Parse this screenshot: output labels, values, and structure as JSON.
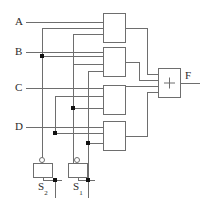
{
  "diagram": {
    "colors": {
      "wire": "#6e6e6e",
      "junction": "#111111",
      "box_fill": "#ffffff",
      "background": "#ffffff",
      "label_text": "#2b2b2b"
    }
  },
  "inputs": [
    {
      "name": "input-a",
      "label": "A",
      "x": 15,
      "y": 16,
      "line_y": 22
    },
    {
      "name": "input-b",
      "label": "B",
      "x": 15,
      "y": 46,
      "line_y": 52
    },
    {
      "name": "input-c",
      "label": "C",
      "x": 15,
      "y": 82,
      "line_y": 88
    },
    {
      "name": "input-d",
      "label": "D",
      "x": 15,
      "y": 121,
      "line_y": 127
    }
  ],
  "gates": [
    {
      "name": "gate-1",
      "label": "",
      "x": 103,
      "y": 13,
      "w": 22,
      "h": 29
    },
    {
      "name": "gate-2",
      "label": "",
      "x": 103,
      "y": 47,
      "w": 22,
      "h": 29
    },
    {
      "name": "gate-3",
      "label": "",
      "x": 103,
      "y": 85,
      "w": 22,
      "h": 29
    },
    {
      "name": "gate-4",
      "label": "",
      "x": 103,
      "y": 121,
      "w": 22,
      "h": 29
    }
  ],
  "adder": {
    "name": "summing-block",
    "symbol": "+",
    "x": 158,
    "y": 68,
    "w": 22,
    "h": 29
  },
  "output": {
    "name": "output-f",
    "label": "F",
    "x": 185,
    "y": 70
  },
  "switches": [
    {
      "name": "switch-s2",
      "label": "S",
      "subscript": "2",
      "box_x": 33,
      "box_y": 163,
      "box_w": 19,
      "box_h": 14,
      "label_x": 38,
      "label_y": 186
    },
    {
      "name": "switch-s1",
      "label": "S",
      "subscript": "1",
      "box_x": 68,
      "box_y": 163,
      "box_w": 19,
      "box_h": 14,
      "label_x": 73,
      "label_y": 186
    }
  ],
  "junctions": [
    {
      "name": "junction-b-s2",
      "x": 42,
      "y": 56
    },
    {
      "name": "junction-mid-c",
      "x": 73,
      "y": 108
    },
    {
      "name": "junction-d-s2",
      "x": 55,
      "y": 133
    },
    {
      "name": "junction-low-right",
      "x": 88,
      "y": 143
    },
    {
      "name": "junction-s2-bottom",
      "x": 55,
      "y": 180
    },
    {
      "name": "junction-s1-bottom",
      "x": 88,
      "y": 180
    }
  ]
}
